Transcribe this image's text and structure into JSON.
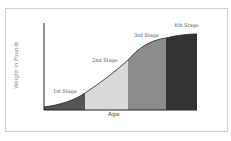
{
  "diagram": {
    "y_axis_label": "Weight in Pounds",
    "x_axis_label": "Age",
    "stages": [
      {
        "label": "1st Stage",
        "color": "#555555"
      },
      {
        "label": "2nd Stage",
        "color": "#d9d9d9"
      },
      {
        "label": "3rd Stage",
        "color": "#8c8c8c"
      },
      {
        "label": "4th Stage",
        "color": "#333333"
      }
    ]
  }
}
